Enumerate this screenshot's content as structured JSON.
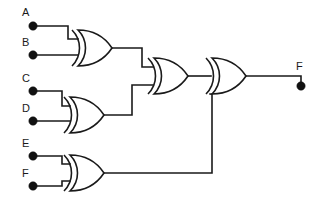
{
  "diagram": {
    "type": "logic-circuit",
    "colors": {
      "background": "#ffffff",
      "wire": "#1a1a1a",
      "terminal": "#111111",
      "gate_fill": "#ffffff"
    },
    "inputs": [
      {
        "id": "A",
        "label": "A",
        "label_x": 22,
        "label_y": 16,
        "dot_x": 33,
        "dot_y": 26
      },
      {
        "id": "B",
        "label": "B",
        "label_x": 22,
        "label_y": 46,
        "dot_x": 33,
        "dot_y": 55
      },
      {
        "id": "C",
        "label": "C",
        "label_x": 22,
        "label_y": 82,
        "dot_x": 33,
        "dot_y": 91
      },
      {
        "id": "D",
        "label": "D",
        "label_x": 22,
        "label_y": 112,
        "dot_x": 33,
        "dot_y": 121
      },
      {
        "id": "E",
        "label": "E",
        "label_x": 22,
        "label_y": 147,
        "dot_x": 33,
        "dot_y": 156
      },
      {
        "id": "F",
        "label": "F",
        "label_x": 22,
        "label_y": 177,
        "dot_x": 33,
        "dot_y": 186
      }
    ],
    "outputs": [
      {
        "id": "F_out",
        "label": "F",
        "label_x": 296,
        "label_y": 70,
        "dot_x": 301,
        "dot_y": 86
      }
    ],
    "gates": [
      {
        "id": "XOR1",
        "type": "xor",
        "label": "XOR",
        "inputs": [
          "A",
          "B"
        ],
        "output": "N1",
        "x": 72,
        "y": 30,
        "w": 38,
        "h": 36
      },
      {
        "id": "XOR2",
        "type": "xor",
        "label": "XOR",
        "inputs": [
          "C",
          "D"
        ],
        "output": "N2",
        "x": 64,
        "y": 97,
        "w": 38,
        "h": 36
      },
      {
        "id": "XOR3",
        "type": "xor",
        "label": "XOR",
        "inputs": [
          "E",
          "F"
        ],
        "output": "N3",
        "x": 64,
        "y": 155,
        "w": 38,
        "h": 36
      },
      {
        "id": "XOR4",
        "type": "xor",
        "label": "XOR",
        "inputs": [
          "N1",
          "N2"
        ],
        "output": "N4",
        "x": 148,
        "y": 58,
        "w": 38,
        "h": 36
      },
      {
        "id": "XOR5",
        "type": "xor",
        "label": "XOR",
        "inputs": [
          "N4",
          "N3"
        ],
        "output": "F_out",
        "x": 206,
        "y": 58,
        "w": 38,
        "h": 36
      }
    ],
    "wires": [
      {
        "id": "w-a",
        "from": "A",
        "to": "XOR1.in0",
        "path": "M33,26 L68,26 L68,39 L78,39"
      },
      {
        "id": "w-b",
        "from": "B",
        "to": "XOR1.in1",
        "path": "M33,55 L78,55"
      },
      {
        "id": "w-c",
        "from": "C",
        "to": "XOR2.in0",
        "path": "M33,91 L62,91 L62,106 L70,106"
      },
      {
        "id": "w-d",
        "from": "D",
        "to": "XOR2.in1",
        "path": "M33,121 L70,121"
      },
      {
        "id": "w-e",
        "from": "E",
        "to": "XOR3.in0",
        "path": "M33,156 L62,156 L62,164 L70,164"
      },
      {
        "id": "w-f",
        "from": "F",
        "to": "XOR3.in1",
        "path": "M33,186 L62,186 L62,181 L70,181"
      },
      {
        "id": "w-n1",
        "from": "XOR1",
        "to": "XOR4.in0",
        "path": "M112,48 L142,48 L142,67 L153,67"
      },
      {
        "id": "w-n2",
        "from": "XOR2",
        "to": "XOR4.in1",
        "path": "M104,115 L132,115 L132,85 L153,85"
      },
      {
        "id": "w-n4",
        "from": "XOR4",
        "to": "XOR5.in0",
        "path": "M188,76 L211,76"
      },
      {
        "id": "w-n3",
        "from": "XOR3",
        "to": "XOR5.in1",
        "path": "M104,173 L212,173 L212,94 L211,94"
      },
      {
        "id": "w-out",
        "from": "XOR5",
        "to": "F_out",
        "path": "M246,76 L301,76 L301,86"
      }
    ]
  }
}
